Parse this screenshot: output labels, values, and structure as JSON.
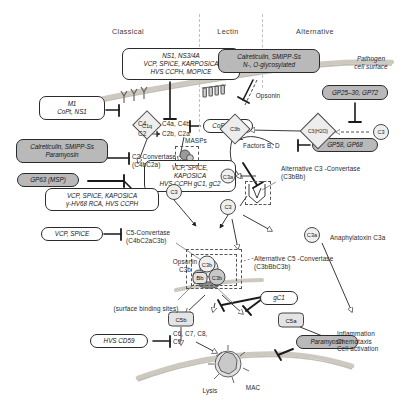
{
  "figure": {
    "type": "diagram"
  },
  "headers": {
    "classical": "Classical",
    "lectin": "Lectin",
    "alternative": "Alternative"
  },
  "surface": {
    "pathogen_cell_surface": "Pathogen\ncell surface",
    "surface_binding_sites": "(surface binding sites)"
  },
  "evasion_boxes": [
    {
      "id": "top-center",
      "text": "NS1, NS3/4A\nVCP, SPICE, KARPOSICA\nHVS CCPH, MOPICE",
      "shaded": false
    },
    {
      "id": "m1",
      "text": "M1\nCoPt, NS1",
      "shaded": false
    },
    {
      "id": "calret-lectin",
      "text": "Calreticulin, SMIPP-Ss\nN-, O-glycosylated",
      "shaded": true
    },
    {
      "id": "gp2530",
      "text": "GP25–30, GP72",
      "shaded": true
    },
    {
      "id": "copt-ns1",
      "text": "CoPT, NS1",
      "shaded": false
    },
    {
      "id": "calret-para",
      "text": "Calreticulin, SMIPP-Ss\nParamyosin",
      "shaded": true
    },
    {
      "id": "gp63",
      "text": "GP63 (MSP)",
      "shaded": true
    },
    {
      "id": "gp58",
      "text": "GP58, GP68",
      "shaded": true
    },
    {
      "id": "vcp-center",
      "text": "VCP, SPICE,\nKAPOSICA\nHVS CCPH gC1, gC2",
      "shaded": false
    },
    {
      "id": "vcp-left",
      "text": "VCP, SPICE, KAPOSICA\nγ-HV68 RCA, HVS CCPH",
      "shaded": false
    },
    {
      "id": "vcp-spice",
      "text": "VCP, SPICE",
      "shaded": false
    },
    {
      "id": "gc1",
      "text": "gC1",
      "shaded": false
    },
    {
      "id": "hvs-cd59",
      "text": "HVS CD59",
      "shaded": false
    },
    {
      "id": "paramyosin",
      "text": "Paramyosin",
      "shaded": true
    }
  ],
  "nodes": {
    "c1q": "C1q",
    "c3_left": "C3",
    "c3b_alt": "C3b",
    "c3h2o": "C3(H2O)",
    "c3_right": "C3",
    "c3_mid": "C3",
    "c3a_mid": "C3a",
    "c3a_alt": "C3a",
    "c3b_1": "C3b",
    "c3b_2": "C3b",
    "bb": "Bb",
    "c5b": "C5b",
    "c5a": "C5a"
  },
  "reactions": {
    "c4": "C4",
    "c4_products": "C4a, C4b",
    "c2": "C2",
    "c2_products": "C2b, C2a",
    "masps": "MASPs",
    "opsonin_top": "Opsonin",
    "factors_bd": "Factors B, D",
    "terminal": "C6, C7, C8,\nC9"
  },
  "convertases": {
    "c2_convertase": "C2-Convertase\n(C4bC2a)",
    "c5_convertase": "C5-Convertase\n(C4bC2aC3b)",
    "alt_c3_convertase": "Alternative C3 -Convertase\n(C3bBb)",
    "alt_c5_convertase": "Alternative C5 -Convertase\n(C3bBbC3b)"
  },
  "annotations": {
    "opsonin_c3b": "Opsonin\nC3b",
    "anaphylatoxin": "Anaphylatoxin C3a",
    "inflammation": "Inflammation\nChemotaxis\nCell activation",
    "lysis": "Lysis",
    "mac": "MAC"
  },
  "colors": {
    "shaded_box": "#b9b9b9",
    "membrane": "#cfcac2",
    "stroke": "#2b2b2b",
    "node_fill": "#efefef"
  }
}
